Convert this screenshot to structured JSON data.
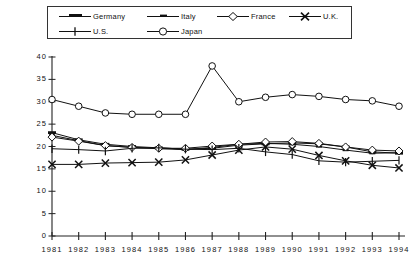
{
  "chart_data": {
    "type": "line",
    "title": "",
    "xlabel": "",
    "ylabel": "",
    "grid": false,
    "legend_position": "top",
    "x": [
      1981,
      1982,
      1983,
      1984,
      1985,
      1986,
      1987,
      1988,
      1989,
      1990,
      1991,
      1992,
      1993,
      1994
    ],
    "xtick_labels": [
      "1981",
      "1982",
      "1983",
      "1984",
      "1985",
      "1986",
      "1987",
      "1988",
      "1989",
      "1990",
      "1991",
      "1992",
      "1993",
      "1994"
    ],
    "ytick_labels": [
      "0",
      "5",
      "10",
      "15",
      "20",
      "25",
      "30",
      "35",
      "40"
    ],
    "yticks": [
      0,
      5,
      10,
      15,
      20,
      25,
      30,
      35,
      40
    ],
    "ylim": [
      0,
      40
    ],
    "xlim": [
      1981,
      1994
    ],
    "series": [
      {
        "name": "Germany",
        "marker": "thick-dash",
        "values": [
          23.1,
          21.5,
          20.5,
          20.0,
          19.7,
          19.4,
          19.6,
          20.3,
          20.6,
          20.8,
          20.6,
          19.9,
          18.8,
          18.5
        ]
      },
      {
        "name": "Italy",
        "marker": "short-dash",
        "values": [
          22.5,
          21.3,
          20.2,
          19.8,
          19.5,
          19.3,
          19.8,
          20.5,
          20.7,
          20.5,
          20.0,
          19.2,
          18.5,
          18.6
        ]
      },
      {
        "name": "France",
        "marker": "open-diamond",
        "values": [
          22.1,
          21.2,
          20.2,
          19.8,
          19.6,
          19.6,
          20.1,
          20.5,
          21.0,
          21.1,
          20.7,
          19.9,
          19.2,
          19.0
        ]
      },
      {
        "name": "U.K.",
        "marker": "x-cross",
        "values": [
          16.0,
          16.0,
          16.3,
          16.4,
          16.5,
          17.0,
          18.1,
          19.2,
          19.9,
          19.4,
          18.0,
          16.8,
          15.8,
          15.2
        ]
      },
      {
        "name": "U.S.",
        "marker": "plus-tick",
        "values": [
          19.5,
          19.3,
          19.0,
          19.6,
          19.7,
          19.4,
          19.3,
          19.6,
          18.8,
          18.2,
          16.8,
          16.5,
          16.7,
          16.9
        ]
      },
      {
        "name": "Japan",
        "marker": "open-circle",
        "values": [
          30.5,
          29.0,
          27.5,
          27.2,
          27.2,
          27.2,
          38.0,
          30.0,
          31.0,
          31.6,
          31.2,
          30.5,
          30.2,
          29.0
        ]
      }
    ]
  },
  "legend": {
    "items": [
      {
        "label": "Germany",
        "marker": "thick-dash"
      },
      {
        "label": "Italy",
        "marker": "short-dash"
      },
      {
        "label": "France",
        "marker": "open-diamond"
      },
      {
        "label": "U.K.",
        "marker": "x-cross"
      },
      {
        "label": "U.S.",
        "marker": "plus-tick"
      },
      {
        "label": "Japan",
        "marker": "open-circle"
      }
    ]
  },
  "colors": {
    "line": "#111111",
    "axis": "#222222",
    "background": "#ffffff"
  }
}
